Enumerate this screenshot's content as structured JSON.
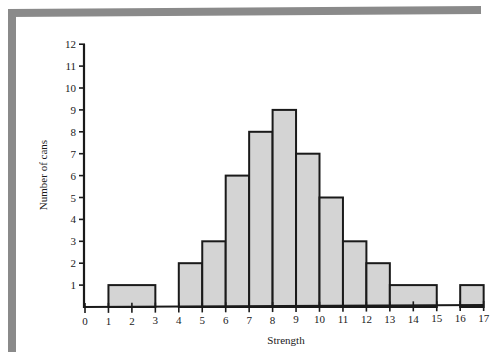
{
  "chart_data": {
    "type": "bar",
    "subtype": "histogram",
    "title": "",
    "xlabel": "Strength",
    "ylabel": "Number of cans",
    "xlim": [
      0,
      17
    ],
    "ylim": [
      0,
      12
    ],
    "x_ticks": [
      0,
      1,
      2,
      3,
      4,
      5,
      6,
      7,
      8,
      9,
      10,
      11,
      12,
      13,
      14,
      15,
      16,
      17
    ],
    "y_ticks": [
      1,
      2,
      3,
      4,
      5,
      6,
      7,
      8,
      9,
      10,
      11,
      12
    ],
    "grid": false,
    "legend": null,
    "bins": [
      {
        "start": 1,
        "end": 3,
        "count": 1
      },
      {
        "start": 4,
        "end": 5,
        "count": 2
      },
      {
        "start": 5,
        "end": 6,
        "count": 3
      },
      {
        "start": 6,
        "end": 7,
        "count": 6
      },
      {
        "start": 7,
        "end": 8,
        "count": 8
      },
      {
        "start": 8,
        "end": 9,
        "count": 9
      },
      {
        "start": 9,
        "end": 10,
        "count": 7
      },
      {
        "start": 10,
        "end": 11,
        "count": 5
      },
      {
        "start": 11,
        "end": 12,
        "count": 3
      },
      {
        "start": 12,
        "end": 13,
        "count": 2
      },
      {
        "start": 13,
        "end": 15,
        "count": 1
      },
      {
        "start": 16,
        "end": 17,
        "count": 1
      }
    ],
    "categories": [
      "1-3",
      "4-5",
      "5-6",
      "6-7",
      "7-8",
      "8-9",
      "9-10",
      "10-11",
      "11-12",
      "12-13",
      "13-15",
      "16-17"
    ],
    "values": [
      1,
      2,
      3,
      6,
      8,
      9,
      7,
      5,
      3,
      2,
      1,
      1
    ]
  },
  "style": {
    "bar_fill": "#d4d4d4",
    "bar_stroke": "#1a1a1a",
    "frame_color": "#8a8a8a"
  }
}
